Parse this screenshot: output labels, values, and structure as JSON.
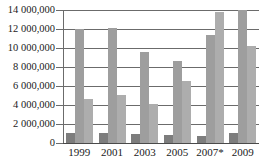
{
  "chart_data": {
    "type": "bar",
    "title": "",
    "subtitle": "",
    "xlabel": "",
    "ylabel": "",
    "grid": true,
    "legend": "none",
    "categories": [
      "1999",
      "2001",
      "2003",
      "2005",
      "2007*",
      "2009"
    ],
    "ylim": [
      0,
      14000000
    ],
    "ytick_values": [
      0,
      2000000,
      4000000,
      6000000,
      8000000,
      10000000,
      12000000,
      14000000
    ],
    "ytick_labels": [
      "0",
      "2 000,000",
      "4 000,000",
      "6 000,000",
      "8 000,000",
      "10 000,000",
      "12 000,000",
      "14 000,000"
    ],
    "series": [
      {
        "name": "series-1",
        "color": "#7d7d7d",
        "values": [
          1050000,
          1040000,
          950000,
          800000,
          720000,
          1030000
        ]
      },
      {
        "name": "series-2",
        "color": "#9e9e9e",
        "values": [
          12050000,
          12100000,
          9550000,
          8650000,
          11400000,
          14900000
        ]
      },
      {
        "name": "series-3",
        "color": "#adadad",
        "values": [
          4600000,
          5050000,
          4150000,
          6550000,
          13800000,
          10200000
        ]
      }
    ]
  },
  "axis": {
    "x_tick_labels": [
      "1999",
      "2001",
      "2003",
      "2005",
      "2007*",
      "2009"
    ]
  }
}
